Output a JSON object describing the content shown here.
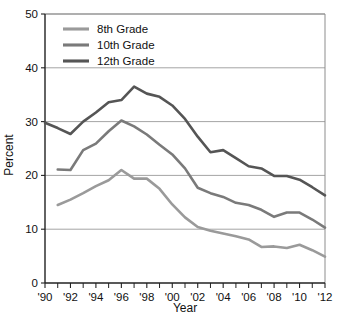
{
  "chart_data": {
    "type": "line",
    "title": "",
    "xlabel": "Year",
    "ylabel": "Percent",
    "xlim": [
      1990,
      2012
    ],
    "ylim": [
      0,
      50
    ],
    "grid": true,
    "legend_position": "top-left",
    "x_tick_labels": [
      "'90",
      "'92",
      "'94",
      "'96",
      "'98",
      "'00",
      "'02",
      "'04",
      "'06",
      "'08",
      "'10",
      "'12"
    ],
    "x_tick_values": [
      1990,
      1992,
      1994,
      1996,
      1998,
      2000,
      2002,
      2004,
      2006,
      2008,
      2010,
      2012
    ],
    "x_minor_ticks": [
      1991,
      1993,
      1995,
      1997,
      1999,
      2001,
      2003,
      2005,
      2007,
      2009,
      2011
    ],
    "y_tick_labels": [
      "0",
      "10",
      "20",
      "30",
      "40",
      "50"
    ],
    "y_tick_values": [
      0,
      10,
      20,
      30,
      40,
      50
    ],
    "series": [
      {
        "name": "8th Grade",
        "color": "#9a9a9a",
        "x": [
          1991,
          1992,
          1993,
          1994,
          1995,
          1996,
          1997,
          1998,
          1999,
          2000,
          2001,
          2002,
          2003,
          2004,
          2005,
          2006,
          2007,
          2008,
          2009,
          2010,
          2011,
          2012
        ],
        "values": [
          14.5,
          15.5,
          16.7,
          18.0,
          19.1,
          21.0,
          19.4,
          19.4,
          17.5,
          14.6,
          12.2,
          10.4,
          9.7,
          9.2,
          8.7,
          8.1,
          6.7,
          6.8,
          6.5,
          7.1,
          6.1,
          4.9
        ]
      },
      {
        "name": "10th Grade",
        "color": "#7a7a7a",
        "x": [
          1991,
          1992,
          1993,
          1994,
          1995,
          1996,
          1997,
          1998,
          1999,
          2000,
          2001,
          2002,
          2003,
          2004,
          2005,
          2006,
          2007,
          2008,
          2009,
          2010,
          2011,
          2012
        ],
        "values": [
          21.1,
          21.0,
          24.7,
          25.9,
          28.2,
          30.2,
          29.1,
          27.6,
          25.7,
          23.9,
          21.3,
          17.7,
          16.7,
          16.0,
          14.9,
          14.5,
          13.6,
          12.3,
          13.1,
          13.1,
          11.8,
          10.3
        ]
      },
      {
        "name": "12th Grade",
        "color": "#555555",
        "x": [
          1990,
          1991,
          1992,
          1993,
          1994,
          1995,
          1996,
          1997,
          1998,
          1999,
          2000,
          2001,
          2002,
          2003,
          2004,
          2005,
          2006,
          2007,
          2008,
          2009,
          2010,
          2011,
          2012
        ],
        "values": [
          29.8,
          28.8,
          27.7,
          30.0,
          31.7,
          33.6,
          34.0,
          36.5,
          35.2,
          34.6,
          33.0,
          30.5,
          27.2,
          24.3,
          24.7,
          23.2,
          21.7,
          21.3,
          19.9,
          19.9,
          19.2,
          17.8,
          16.3
        ]
      }
    ]
  },
  "legend": {
    "items": [
      {
        "label": "8th Grade"
      },
      {
        "label": "10th Grade"
      },
      {
        "label": "12th Grade"
      }
    ]
  },
  "axes": {
    "y_title": "Percent",
    "x_title": "Year"
  }
}
